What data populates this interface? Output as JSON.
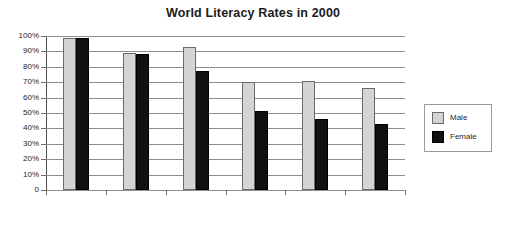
{
  "chart_data": {
    "type": "bar",
    "title": "World Literacy Rates in 2000",
    "xlabel": "",
    "ylabel": "",
    "ylim": [
      0,
      100
    ],
    "yticks": [
      0,
      10,
      20,
      30,
      40,
      50,
      60,
      70,
      80,
      90,
      100
    ],
    "ytick_labels": [
      "0",
      "10%",
      "20%",
      "30%",
      "40%",
      "50%",
      "60%",
      "70%",
      "80%",
      "90%",
      "100%"
    ],
    "grid": true,
    "legend_position": "right",
    "categories": [
      "Developed\nCountries",
      "Latin America",
      "East Asia",
      "Sub-Saharan\nAfrica",
      "Arab States",
      "South Asia"
    ],
    "series": [
      {
        "name": "Male",
        "color": "#d4d4d4",
        "values": [
          99,
          89,
          93,
          70,
          71,
          66
        ]
      },
      {
        "name": "Female",
        "color": "#111111",
        "values": [
          99,
          88,
          77,
          51,
          46,
          43
        ]
      }
    ]
  },
  "legend": {
    "items": [
      {
        "label": "Male"
      },
      {
        "label": "Female"
      }
    ]
  }
}
